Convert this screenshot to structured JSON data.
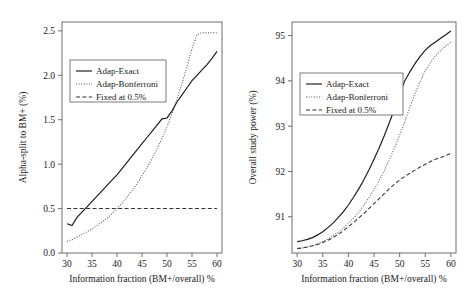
{
  "figure": {
    "background": "#ffffff",
    "panel_count": 2
  },
  "chart_data": [
    {
      "id": "left-panel",
      "type": "line",
      "title": "",
      "xlabel": "Information fraction (BM+/overall) %",
      "ylabel": "Alpha-split to BM+ (%)",
      "xlim": [
        29,
        61
      ],
      "ylim": [
        0.0,
        2.6
      ],
      "xticks": [
        30,
        35,
        40,
        45,
        50,
        55,
        60
      ],
      "xticklabels": [
        "30",
        "35",
        "40",
        "45",
        "50",
        "55",
        "60"
      ],
      "yticks": [
        0.0,
        0.5,
        1.0,
        1.5,
        2.0,
        2.5
      ],
      "yticklabels": [
        "0.0",
        "0.5",
        "1.0",
        "1.5",
        "2.0",
        "2.5"
      ],
      "grid": false,
      "legend_position": "upper-left",
      "x": [
        30,
        31,
        32,
        33,
        34,
        35,
        36,
        37,
        38,
        39,
        40,
        41,
        42,
        43,
        44,
        45,
        46,
        47,
        48,
        49,
        50,
        51,
        52,
        53,
        54,
        55,
        56,
        57,
        58,
        59,
        60
      ],
      "series": [
        {
          "name": "Adap-Exact",
          "style": "solid",
          "color": "#1a1a1a",
          "values": [
            0.33,
            0.31,
            0.4,
            0.46,
            0.52,
            0.58,
            0.64,
            0.7,
            0.76,
            0.82,
            0.88,
            0.95,
            1.02,
            1.09,
            1.16,
            1.23,
            1.3,
            1.37,
            1.44,
            1.51,
            1.52,
            1.6,
            1.7,
            1.78,
            1.86,
            1.94,
            2.0,
            2.06,
            2.12,
            2.19,
            2.27
          ]
        },
        {
          "name": "Adap-Bonferroni",
          "style": "dotted",
          "color": "#555555",
          "values": [
            0.13,
            0.15,
            0.18,
            0.21,
            0.24,
            0.27,
            0.31,
            0.35,
            0.39,
            0.44,
            0.5,
            0.56,
            0.63,
            0.7,
            0.78,
            0.87,
            0.96,
            1.06,
            1.17,
            1.29,
            1.42,
            1.57,
            1.73,
            1.91,
            2.1,
            2.3,
            2.46,
            2.48,
            2.48,
            2.48,
            2.48
          ]
        },
        {
          "name": "Fixed at 0.5%",
          "style": "dashed",
          "color": "#333333",
          "values": [
            0.5,
            0.5,
            0.5,
            0.5,
            0.5,
            0.5,
            0.5,
            0.5,
            0.5,
            0.5,
            0.5,
            0.5,
            0.5,
            0.5,
            0.5,
            0.5,
            0.5,
            0.5,
            0.5,
            0.5,
            0.5,
            0.5,
            0.5,
            0.5,
            0.5,
            0.5,
            0.5,
            0.5,
            0.5,
            0.5,
            0.5
          ]
        }
      ]
    },
    {
      "id": "right-panel",
      "type": "line",
      "title": "",
      "xlabel": "Information fraction (BM+/overall) %",
      "ylabel": "Overall study power (%)",
      "xlim": [
        29,
        61
      ],
      "ylim": [
        90.2,
        95.3
      ],
      "xticks": [
        30,
        35,
        40,
        45,
        50,
        55,
        60
      ],
      "xticklabels": [
        "30",
        "35",
        "40",
        "45",
        "50",
        "55",
        "60"
      ],
      "yticks": [
        91,
        92,
        93,
        94,
        95
      ],
      "yticklabels": [
        "91",
        "92",
        "93",
        "94",
        "95"
      ],
      "grid": false,
      "legend_position": "upper-left",
      "x": [
        30,
        31,
        32,
        33,
        34,
        35,
        36,
        37,
        38,
        39,
        40,
        41,
        42,
        43,
        44,
        45,
        46,
        47,
        48,
        49,
        50,
        51,
        52,
        53,
        54,
        55,
        56,
        57,
        58,
        59,
        60
      ],
      "series": [
        {
          "name": "Adap-Exact",
          "style": "solid",
          "color": "#1a1a1a",
          "values": [
            90.45,
            90.47,
            90.5,
            90.54,
            90.6,
            90.67,
            90.76,
            90.86,
            90.98,
            91.11,
            91.26,
            91.43,
            91.61,
            91.81,
            92.03,
            92.27,
            92.52,
            92.79,
            93.08,
            93.38,
            93.7,
            94.0,
            94.2,
            94.38,
            94.54,
            94.68,
            94.78,
            94.86,
            94.94,
            95.02,
            95.1
          ]
        },
        {
          "name": "Adap-Bonferroni",
          "style": "dotted",
          "color": "#555555",
          "values": [
            90.3,
            90.31,
            90.33,
            90.36,
            90.4,
            90.45,
            90.51,
            90.58,
            90.66,
            90.75,
            90.85,
            90.97,
            91.1,
            91.25,
            91.42,
            91.6,
            91.8,
            92.02,
            92.26,
            92.52,
            92.8,
            93.1,
            93.42,
            93.72,
            93.99,
            94.22,
            94.4,
            94.55,
            94.67,
            94.77,
            94.86
          ]
        },
        {
          "name": "Fixed at 0.5%",
          "style": "dashed",
          "color": "#333333",
          "values": [
            90.3,
            90.31,
            90.33,
            90.36,
            90.39,
            90.43,
            90.48,
            90.54,
            90.61,
            90.69,
            90.78,
            90.87,
            90.97,
            91.07,
            91.18,
            91.29,
            91.4,
            91.51,
            91.62,
            91.72,
            91.81,
            91.89,
            91.96,
            92.03,
            92.1,
            92.16,
            92.22,
            92.27,
            92.31,
            92.35,
            92.4
          ]
        }
      ]
    }
  ]
}
